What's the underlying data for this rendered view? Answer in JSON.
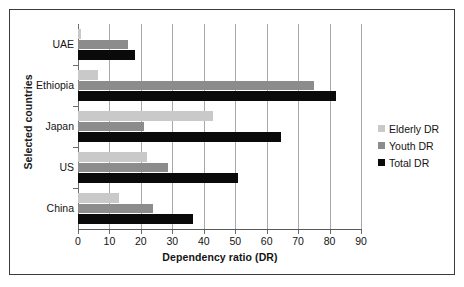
{
  "chart_data": {
    "type": "bar",
    "orientation": "horizontal",
    "title": "",
    "xlabel": "Dependency ratio (DR)",
    "ylabel": "Selected countries",
    "categories": [
      "UAE",
      "Ethiopia",
      "Japan",
      "US",
      "China"
    ],
    "series": [
      {
        "name": "Elderly DR",
        "color": "#c9c9c9",
        "values": [
          1,
          6.5,
          43,
          22,
          13
        ]
      },
      {
        "name": "Youth DR",
        "color": "#8c8c8c",
        "values": [
          16,
          75,
          21,
          28.5,
          24
        ]
      },
      {
        "name": "Total DR",
        "color": "#0a0a0a",
        "values": [
          18,
          82,
          64.5,
          51,
          36.5
        ]
      }
    ],
    "xlim": [
      0,
      90
    ],
    "xticks": [
      0,
      10,
      20,
      30,
      40,
      50,
      60,
      70,
      80,
      90
    ],
    "xticklabels": [
      "0",
      "10",
      "20",
      "30",
      "40",
      "50",
      "60",
      "70",
      "80",
      "90"
    ],
    "grid": "vertical",
    "legend_position": "right",
    "legend": [
      "Elderly DR",
      "Youth DR",
      "Total DR"
    ]
  },
  "axes": {
    "x_title": "Dependency ratio (DR)",
    "y_title": "Selected countries"
  },
  "legend": {
    "items": [
      {
        "label": "Elderly DR",
        "color": "#c9c9c9"
      },
      {
        "label": "Youth DR",
        "color": "#8c8c8c"
      },
      {
        "label": "Total DR",
        "color": "#0a0a0a"
      }
    ]
  }
}
